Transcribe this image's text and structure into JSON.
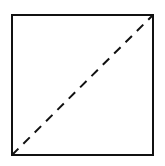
{
  "diagram": {
    "canvas": {
      "width": 165,
      "height": 166,
      "background": "#ffffff"
    },
    "square": {
      "x": 12,
      "y": 15,
      "width": 141,
      "height": 140,
      "stroke": "#111111",
      "stroke_width": 2
    },
    "diagonal": {
      "x1": 12,
      "y1": 155,
      "x2": 153,
      "y2": 15,
      "stroke": "#111111",
      "stroke_width": 2,
      "dash": "9 7",
      "style": "dashed"
    }
  }
}
